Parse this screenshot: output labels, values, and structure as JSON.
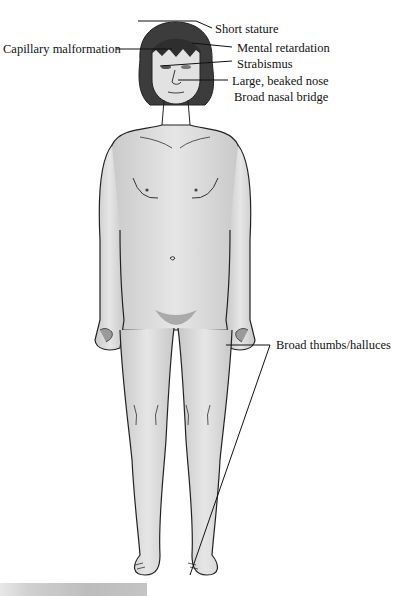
{
  "figure": {
    "labels": [
      {
        "id": "short-stature",
        "text": "Short stature"
      },
      {
        "id": "capillary-malformation",
        "text": "Capillary malformation"
      },
      {
        "id": "mental-retardation",
        "text": "Mental retardation"
      },
      {
        "id": "strabismus",
        "text": "Strabismus"
      },
      {
        "id": "beaked-nose",
        "text": "Large, beaked nose"
      },
      {
        "id": "nasal-bridge",
        "text": "Broad nasal bridge"
      },
      {
        "id": "broad-thumbs",
        "text": "Broad thumbs/halluces"
      }
    ]
  },
  "colors": {
    "skin": "#dcdcdc",
    "hair": "#3a3a3a",
    "outline": "#222222",
    "text": "#111111"
  }
}
